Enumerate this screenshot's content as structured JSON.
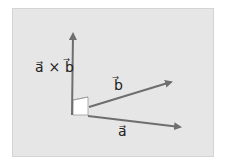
{
  "diagram": {
    "background_color": "#e6e6e6",
    "arrow_color": "#6e6e6e",
    "origin": [
      72,
      115
    ],
    "vectors": [
      {
        "name": "a",
        "label": "a⃗",
        "tip": [
          184,
          127
        ]
      },
      {
        "name": "b",
        "label": "b⃗",
        "tip": [
          175,
          81
        ]
      },
      {
        "name": "a_cross_b",
        "label": "a⃗ × b⃗",
        "tip": [
          73,
          30
        ]
      }
    ],
    "labels": {
      "cross": "a⃗ × b⃗",
      "b": "b⃗",
      "a": "a⃗"
    }
  }
}
